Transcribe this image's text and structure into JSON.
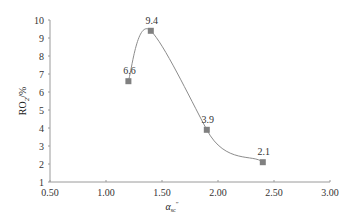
{
  "chart_data": {
    "type": "line",
    "title": "",
    "xlabel": "α_sc″",
    "xlabel_parts": {
      "base": "α",
      "sub": "sc",
      "sup": "″"
    },
    "ylabel": "RO₂/%",
    "ylabel_parts": {
      "base": "RO",
      "sub": "2",
      "rest": "/%"
    },
    "xlim": [
      0.5,
      3.0
    ],
    "ylim": [
      1,
      10
    ],
    "x_ticks": [
      "0.50",
      "1.00",
      "1.50",
      "2.00",
      "2.50",
      "3.00"
    ],
    "y_ticks": [
      "1",
      "2",
      "3",
      "4",
      "5",
      "6",
      "7",
      "8",
      "9",
      "10"
    ],
    "grid": false,
    "legend": null,
    "smooth": true,
    "series": [
      {
        "name": "RO2",
        "marker": "square",
        "color": "#808080",
        "line_color": "#8c8c8c",
        "points": [
          {
            "x": 1.2,
            "y": 6.6,
            "label": "6.6"
          },
          {
            "x": 1.4,
            "y": 9.4,
            "label": "9.4"
          },
          {
            "x": 1.9,
            "y": 3.9,
            "label": "3.9"
          },
          {
            "x": 2.4,
            "y": 2.1,
            "label": "2.1"
          }
        ]
      }
    ]
  },
  "layout": {
    "plot_left": 50,
    "plot_right": 330,
    "plot_top": 20,
    "plot_bottom": 182,
    "axis_color": "#9a9a9a"
  }
}
